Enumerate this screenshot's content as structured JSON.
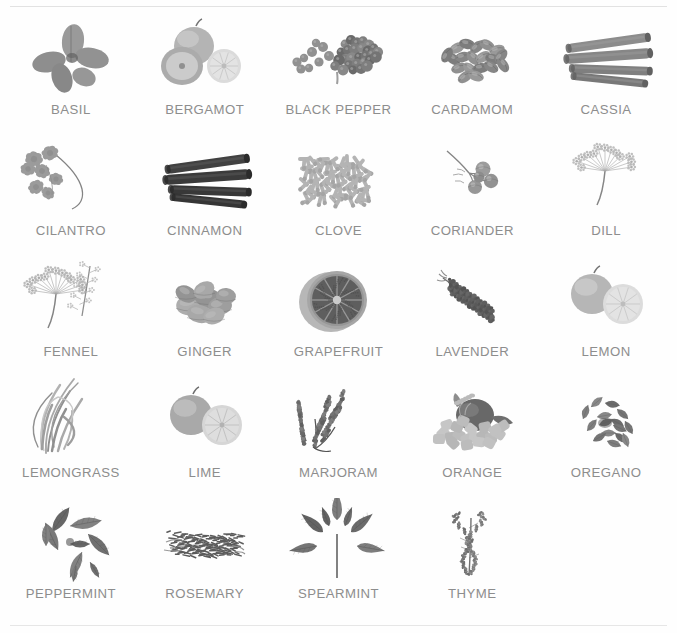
{
  "page": {
    "label_color": "#8d8d8d",
    "background_color": "#ffffff",
    "columns": 5,
    "rows": 5,
    "item_count": 24
  },
  "items": [
    {
      "label": "BASIL",
      "icon": "basil-leaves-icon",
      "tone": "#9a9a9a"
    },
    {
      "label": "BERGAMOT",
      "icon": "bergamot-citrus-icon",
      "tone": "#b4b4b4"
    },
    {
      "label": "BLACK PEPPER",
      "icon": "black-peppercorns-icon",
      "tone": "#8f8f8f"
    },
    {
      "label": "CARDAMOM",
      "icon": "cardamom-pods-icon",
      "tone": "#9c9c9c"
    },
    {
      "label": "CASSIA",
      "icon": "cassia-bark-icon",
      "tone": "#8a8a8a"
    },
    {
      "label": "CILANTRO",
      "icon": "cilantro-sprig-icon",
      "tone": "#a0a0a0"
    },
    {
      "label": "CINNAMON",
      "icon": "cinnamon-sticks-icon",
      "tone": "#3a3a3a"
    },
    {
      "label": "CLOVE",
      "icon": "clove-pile-icon",
      "tone": "#bcbcbc"
    },
    {
      "label": "CORIANDER",
      "icon": "coriander-berries-icon",
      "tone": "#a6a6a6"
    },
    {
      "label": "DILL",
      "icon": "dill-umbel-icon",
      "tone": "#c0c0c0"
    },
    {
      "label": "FENNEL",
      "icon": "fennel-umbel-icon",
      "tone": "#bdbdbd"
    },
    {
      "label": "GINGER",
      "icon": "ginger-root-icon",
      "tone": "#a8a8a8"
    },
    {
      "label": "GRAPEFRUIT",
      "icon": "grapefruit-half-icon",
      "tone": "#5e5e5e"
    },
    {
      "label": "LAVENDER",
      "icon": "lavender-sprig-icon",
      "tone": "#6a6a6a"
    },
    {
      "label": "LEMON",
      "icon": "lemon-citrus-icon",
      "tone": "#b6b6b6"
    },
    {
      "label": "LEMONGRASS",
      "icon": "lemongrass-stalks-icon",
      "tone": "#b0b0b0"
    },
    {
      "label": "LIME",
      "icon": "lime-citrus-icon",
      "tone": "#a9a9a9"
    },
    {
      "label": "MARJORAM",
      "icon": "marjoram-sprig-icon",
      "tone": "#6d6d6d"
    },
    {
      "label": "ORANGE",
      "icon": "orange-arrangement-icon",
      "tone": "#9d9d9d"
    },
    {
      "label": "OREGANO",
      "icon": "oregano-leaves-icon",
      "tone": "#8b8b8b"
    },
    {
      "label": "PEPPERMINT",
      "icon": "peppermint-leaves-icon",
      "tone": "#7f7f7f"
    },
    {
      "label": "ROSEMARY",
      "icon": "rosemary-bundle-icon",
      "tone": "#6f6f6f"
    },
    {
      "label": "SPEARMINT",
      "icon": "spearmint-sprig-icon",
      "tone": "#7a7a7a"
    },
    {
      "label": "THYME",
      "icon": "thyme-sprig-icon",
      "tone": "#7d7d7d"
    }
  ]
}
